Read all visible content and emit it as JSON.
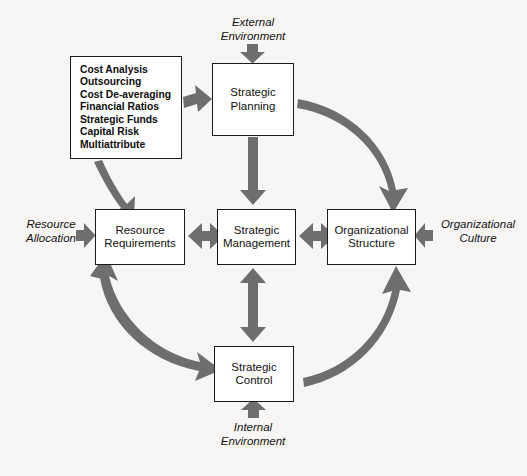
{
  "diagram": {
    "arrow_color": "#6e6e6e",
    "box_border_color": "#1a1a1a",
    "background_color": "#f7f6f4",
    "text_color": "#111111"
  },
  "nodes": {
    "strategic_planning": "Strategic\nPlanning",
    "resource_requirements": "Resource\nRequirements",
    "strategic_management": "Strategic\nManagement",
    "organizational_structure": "Organizational\nStructure",
    "strategic_control": "Strategic\nControl"
  },
  "techniques": {
    "items": [
      "Cost Analysis",
      "Outsourcing",
      "Cost De-averaging",
      "Financial Ratios",
      "Strategic Funds",
      "Capital Risk",
      "Multiattribute"
    ]
  },
  "environment_labels": {
    "external": "External\nEnvironment",
    "internal": "Internal\nEnvironment",
    "resource_allocation": "Resource\nAllocation",
    "organizational_culture": "Organizational\nCulture"
  },
  "connectors": [
    {
      "name": "external-environment-to-strategic-planning",
      "style": "single",
      "direction": "down"
    },
    {
      "name": "internal-environment-to-strategic-control",
      "style": "single",
      "direction": "up"
    },
    {
      "name": "resource-allocation-to-resource-requirements",
      "style": "single",
      "direction": "right"
    },
    {
      "name": "organizational-culture-to-organizational-structure",
      "style": "single",
      "direction": "left"
    },
    {
      "name": "techniques-to-strategic-planning",
      "style": "single",
      "direction": "right"
    },
    {
      "name": "techniques-to-resource-requirements",
      "style": "single",
      "direction": "down"
    },
    {
      "name": "strategic-planning-to-strategic-management",
      "style": "single",
      "direction": "down"
    },
    {
      "name": "strategic-management-to-strategic-control",
      "style": "double",
      "direction": "vertical"
    },
    {
      "name": "resource-requirements-to-strategic-management",
      "style": "double",
      "direction": "horizontal"
    },
    {
      "name": "strategic-management-to-organizational-structure",
      "style": "double",
      "direction": "horizontal"
    },
    {
      "name": "strategic-planning-to-organizational-structure-arc",
      "style": "single",
      "direction": "clockwise"
    },
    {
      "name": "strategic-control-to-organizational-structure-arc",
      "style": "single",
      "direction": "counter-clockwise"
    },
    {
      "name": "resource-requirements-to-strategic-control-arc",
      "style": "double",
      "direction": "both"
    },
    {
      "name": "strategic-planning-to-resource-requirements-arc",
      "style": "single",
      "direction": "down-left"
    }
  ]
}
